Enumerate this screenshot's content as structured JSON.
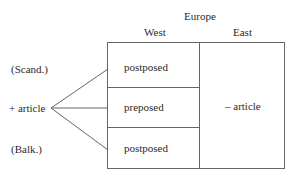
{
  "header": {
    "title": "Europe",
    "columns": [
      "West",
      "East"
    ]
  },
  "left_labels": {
    "top": "(Scand.)",
    "middle": "+ article",
    "bottom": "(Balk.)"
  },
  "west_cells": [
    "postposed",
    "preposed",
    "postposed"
  ],
  "east_cell": "– article",
  "colors": {
    "line": "#555555",
    "text": "#2a2a2a"
  }
}
